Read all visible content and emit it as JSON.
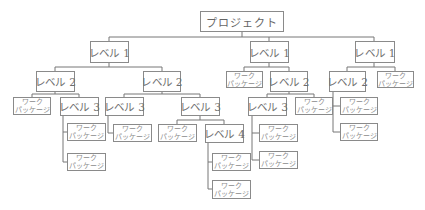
{
  "diagram": {
    "type": "wbs-tree",
    "labels": {
      "project": "プロジェクト",
      "level1": "レベル 1",
      "level2": "レベル 2",
      "level3": "レベル 3",
      "level4": "レベル 4",
      "work_package_line1": "ワーク",
      "work_package_line2": "パッケージ"
    },
    "nodes": [
      {
        "id": "p",
        "text": "プロジェクト",
        "x": 200,
        "y": 11,
        "w": 84,
        "h": 21
      },
      {
        "id": "l1a",
        "text": "レベル 1",
        "x": 90,
        "y": 41,
        "w": 39,
        "h": 22
      },
      {
        "id": "l1b",
        "text": "レベル 1",
        "x": 250,
        "y": 41,
        "w": 39,
        "h": 22
      },
      {
        "id": "l1c",
        "text": "レベル 1",
        "x": 355,
        "y": 41,
        "w": 40,
        "h": 22
      },
      {
        "id": "l2a",
        "text": "レベル 2",
        "x": 36,
        "y": 71,
        "w": 39,
        "h": 21
      },
      {
        "id": "l2b",
        "text": "レベル 2",
        "x": 143,
        "y": 71,
        "w": 38,
        "h": 21
      },
      {
        "id": "wp1",
        "wp": true,
        "x": 226,
        "y": 71,
        "w": 37,
        "h": 17
      },
      {
        "id": "l2c",
        "text": "レベル 2",
        "x": 270,
        "y": 71,
        "w": 38,
        "h": 21
      },
      {
        "id": "l2d",
        "text": "レベル 2",
        "x": 329,
        "y": 71,
        "w": 37,
        "h": 21
      },
      {
        "id": "wp2",
        "wp": true,
        "x": 377,
        "y": 71,
        "w": 37,
        "h": 17
      },
      {
        "id": "wp3",
        "wp": true,
        "x": 13,
        "y": 97,
        "w": 38,
        "h": 18
      },
      {
        "id": "l3a",
        "text": "レベル 3",
        "x": 60,
        "y": 97,
        "w": 39,
        "h": 19
      },
      {
        "id": "l3b",
        "text": "レベル 3",
        "x": 105,
        "y": 97,
        "w": 39,
        "h": 19
      },
      {
        "id": "l3c",
        "text": "レベル 3",
        "x": 181,
        "y": 97,
        "w": 39,
        "h": 19
      },
      {
        "id": "l3d",
        "text": "レベル 3",
        "x": 248,
        "y": 97,
        "w": 39,
        "h": 19
      },
      {
        "id": "wp4",
        "wp": true,
        "x": 295,
        "y": 97,
        "w": 38,
        "h": 18
      },
      {
        "id": "wp5",
        "wp": true,
        "x": 340,
        "y": 97,
        "w": 38,
        "h": 18
      },
      {
        "id": "wp6",
        "wp": true,
        "x": 67,
        "y": 123,
        "w": 39,
        "h": 18
      },
      {
        "id": "wp7",
        "wp": true,
        "x": 113,
        "y": 124,
        "w": 39,
        "h": 18
      },
      {
        "id": "wp8",
        "wp": true,
        "x": 158,
        "y": 124,
        "w": 39,
        "h": 18
      },
      {
        "id": "l4a",
        "text": "レベル 4",
        "x": 205,
        "y": 124,
        "w": 39,
        "h": 19
      },
      {
        "id": "wp9",
        "wp": true,
        "x": 259,
        "y": 124,
        "w": 39,
        "h": 18
      },
      {
        "id": "wp10",
        "wp": true,
        "x": 340,
        "y": 123,
        "w": 38,
        "h": 18
      },
      {
        "id": "wp11",
        "wp": true,
        "x": 67,
        "y": 153,
        "w": 39,
        "h": 18
      },
      {
        "id": "wp12",
        "wp": true,
        "x": 212,
        "y": 153,
        "w": 39,
        "h": 18
      },
      {
        "id": "wp13",
        "wp": true,
        "x": 259,
        "y": 151,
        "w": 39,
        "h": 18
      },
      {
        "id": "wp14",
        "wp": true,
        "x": 212,
        "y": 180,
        "w": 39,
        "h": 19
      }
    ],
    "connectors": [
      {
        "pts": "242,32 242,37"
      },
      {
        "pts": "109,37 374,37"
      },
      {
        "pts": "109,37 109,41"
      },
      {
        "pts": "269,37 269,41"
      },
      {
        "pts": "374,37 374,41"
      },
      {
        "pts": "109,63 109,67"
      },
      {
        "pts": "55,67 162,67"
      },
      {
        "pts": "55,67 55,71"
      },
      {
        "pts": "162,67 162,71"
      },
      {
        "pts": "269,63 269,67"
      },
      {
        "pts": "244,67 289,67"
      },
      {
        "pts": "244,67 244,71"
      },
      {
        "pts": "289,67 289,71"
      },
      {
        "pts": "374,63 374,67"
      },
      {
        "pts": "347,67 395,67"
      },
      {
        "pts": "347,67 347,71"
      },
      {
        "pts": "395,67 395,71"
      },
      {
        "pts": "55,92 55,94"
      },
      {
        "pts": "32,94 79,94"
      },
      {
        "pts": "32,94 32,97"
      },
      {
        "pts": "79,94 79,97"
      },
      {
        "pts": "162,92 162,94"
      },
      {
        "pts": "124,94 200,94"
      },
      {
        "pts": "124,94 124,97"
      },
      {
        "pts": "200,94 200,97"
      },
      {
        "pts": "289,92 289,94"
      },
      {
        "pts": "267,94 314,94"
      },
      {
        "pts": "267,94 267,97"
      },
      {
        "pts": "314,94 314,97"
      },
      {
        "pts": "333,92 333,132 340,132"
      },
      {
        "pts": "333,106 340,106"
      },
      {
        "pts": "63,116 63,162 67,162"
      },
      {
        "pts": "63,132 67,132"
      },
      {
        "pts": "108,116 108,133 113,133"
      },
      {
        "pts": "200,116 200,120"
      },
      {
        "pts": "177,120 224,120"
      },
      {
        "pts": "177,120 177,124"
      },
      {
        "pts": "224,120 224,124"
      },
      {
        "pts": "208,143 208,189 212,189"
      },
      {
        "pts": "208,162 212,162"
      },
      {
        "pts": "252,116 252,160 259,160"
      },
      {
        "pts": "252,133 259,133"
      }
    ]
  }
}
